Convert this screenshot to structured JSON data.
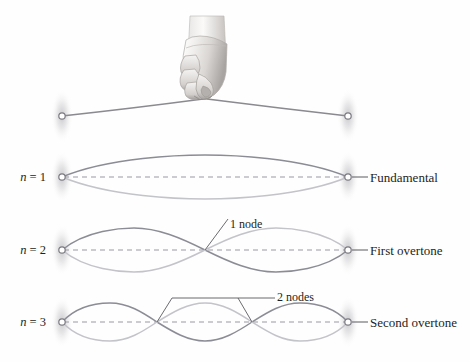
{
  "figure": {
    "background_color": "#fefefe",
    "ink_color": "#231f20",
    "wave_dark_color": "#8c8c96",
    "wave_light_color": "#c3c3ca",
    "string_color": "#8a8a90",
    "axis_dash_color": "#9a9aa2",
    "peg_color": "#7a7a80",
    "blur_color": "#b8b8bc"
  },
  "hand": {
    "icon_name": "hand-fist-gripping-string",
    "skin_shade_light": "#f2f0ee",
    "skin_shade_mid": "#d6d3d0",
    "skin_shade_dark": "#9c9895"
  },
  "rows": [
    {
      "id": "plucked",
      "mode_label": "",
      "mode_label_n": "",
      "overtone_label": "",
      "node_label": "",
      "nodes": 0,
      "y": 112,
      "description": "String pulled up at center by hand"
    },
    {
      "id": "n1",
      "mode_label": "n = 1",
      "mode_label_n": "n",
      "mode_label_rest": " = 1",
      "overtone_label": "Fundamental",
      "node_label": "",
      "nodes": 0,
      "harmonic": 1,
      "y": 177,
      "amplitude": 16
    },
    {
      "id": "n2",
      "mode_label": "n = 2",
      "mode_label_n": "n",
      "mode_label_rest": " = 2",
      "overtone_label": "First overtone",
      "node_label": "1 node",
      "nodes": 1,
      "harmonic": 2,
      "y": 250,
      "amplitude": 16
    },
    {
      "id": "n3",
      "mode_label": "n = 3",
      "mode_label_n": "n",
      "mode_label_rest": " = 3",
      "overtone_label": "Second overtone",
      "node_label": "2 nodes",
      "nodes": 2,
      "harmonic": 3,
      "y": 322,
      "amplitude": 15
    }
  ],
  "geometry": {
    "left_peg_x": 62,
    "right_peg_x": 348,
    "hand_x": 205,
    "top_string_apex_y": 98,
    "top_string_end_y": 116
  },
  "labels": {
    "n1": "n = 1",
    "n2": "n = 2",
    "n3": "n = 3",
    "fundamental": "Fundamental",
    "first_overtone": "First overtone",
    "second_overtone": "Second overtone",
    "one_node": "1 node",
    "two_nodes": "2 nodes"
  }
}
